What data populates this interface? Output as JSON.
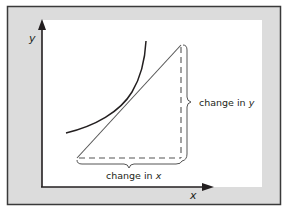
{
  "diagram": {
    "type": "slope-of-tangent-illustration",
    "colors": {
      "frame_fill": "#dcdcdc",
      "frame_border": "#3a3a3a",
      "plot_bg": "#ffffff",
      "ink": "#231f20",
      "line": "#555555"
    },
    "axes": {
      "x_label": "x",
      "y_label": "y"
    },
    "curve": {
      "description": "increasing convex curve",
      "start": [
        66,
        133
      ],
      "end": [
        146,
        41
      ]
    },
    "tangent_line": {
      "start": [
        77,
        158
      ],
      "end": [
        181,
        45
      ]
    },
    "annotations": {
      "change_in_x_prefix": "change in ",
      "change_in_x_var": "x",
      "change_in_y_prefix": "change in ",
      "change_in_y_var": "y"
    }
  }
}
